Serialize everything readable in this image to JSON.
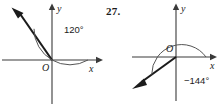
{
  "problem": {
    "number_label": "27."
  },
  "figures": [
    {
      "id": "angle-120",
      "origin_label": "O",
      "x_axis_label": "x",
      "y_axis_label": "y",
      "angle_label": "120°",
      "angle_degrees": 120,
      "direction": "counterclockwise",
      "ray_direction_label": "upper-left",
      "colors": {
        "axis": "#3a3a3a",
        "ray": "#1b1b1b",
        "arc": "#555555",
        "text": "#1b1b1b",
        "background": "#ffffff"
      }
    },
    {
      "id": "angle-minus-144",
      "origin_label": "O",
      "x_axis_label": "x",
      "y_axis_label": "y",
      "angle_label": "−144°",
      "angle_degrees": -144,
      "direction": "clockwise",
      "ray_direction_label": "lower-left",
      "colors": {
        "axis": "#3a3a3a",
        "ray": "#1b1b1b",
        "arc": "#555555",
        "text": "#1b1b1b",
        "background": "#ffffff"
      }
    }
  ]
}
